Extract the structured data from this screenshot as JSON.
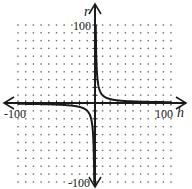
{
  "chart_data": {
    "type": "line",
    "title": "",
    "xlabel": "h",
    "ylabel": "r",
    "xlim": [
      -100,
      100
    ],
    "ylim": [
      -100,
      100
    ],
    "grid": "dotted",
    "grid_step": 10,
    "x_tick_labels": [
      "-100",
      "100"
    ],
    "y_tick_labels": [
      "100",
      "-100"
    ],
    "legend": null,
    "series": [
      {
        "name": "r = k/h (branch h>0)",
        "x": [
          1,
          2,
          3,
          5,
          8,
          12,
          20,
          30,
          50,
          70,
          100
        ],
        "y": [
          100,
          50,
          33.3,
          20,
          12.5,
          8.3,
          5,
          3.3,
          2,
          1.4,
          1
        ]
      },
      {
        "name": "r = k/h (branch h<0)",
        "x": [
          -100,
          -70,
          -50,
          -30,
          -20,
          -12,
          -8,
          -5,
          -3,
          -2,
          -1
        ],
        "y": [
          -1,
          -1.4,
          -2,
          -3.3,
          -5,
          -8.3,
          -12.5,
          -20,
          -33.3,
          -50,
          -100
        ]
      }
    ],
    "k": 100
  },
  "labels": {
    "y_axis_name": "r",
    "x_axis_name": "h",
    "y_max": "100",
    "y_min": "-100",
    "x_min": "-100",
    "x_max": "100"
  },
  "colors": {
    "axis": "#1a1a1a",
    "curve": "#1a1a1a",
    "grid_dot": "#6a6a6a"
  }
}
